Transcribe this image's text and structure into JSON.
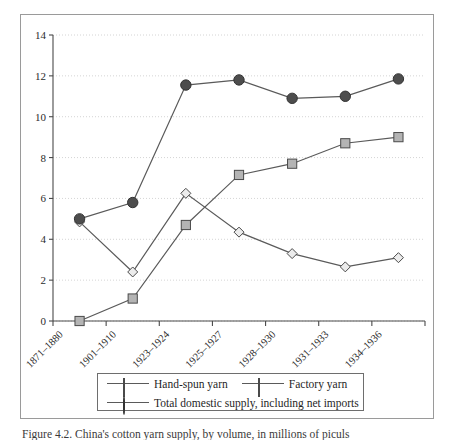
{
  "figure": {
    "caption": "Figure 4.2.   China's cotton yarn supply, by volume, in millions of piculs"
  },
  "chart_data": {
    "type": "line",
    "title": "",
    "xlabel": "",
    "ylabel": "",
    "ylim": [
      0,
      14
    ],
    "yticks": [
      0,
      2,
      4,
      6,
      8,
      10,
      12,
      14
    ],
    "grid": true,
    "legend_position": "bottom",
    "categories": [
      "1871–1880",
      "1901–1910",
      "1923–1924",
      "1925–1927",
      "1928–1930",
      "1931–1933",
      "1934–1936"
    ],
    "series": [
      {
        "name": "Hand-spun yarn",
        "marker": "diamond",
        "marker_fill": "#ececec",
        "line_color": "#5a5a5a",
        "values": [
          4.85,
          2.4,
          6.25,
          4.35,
          3.3,
          2.65,
          3.1
        ]
      },
      {
        "name": "Factory yarn",
        "marker": "square",
        "marker_fill": "#b4b4b4",
        "line_color": "#5a5a5a",
        "values": [
          0.0,
          1.1,
          4.7,
          7.15,
          7.7,
          8.7,
          9.0
        ]
      },
      {
        "name": "Total domestic supply, including net imports",
        "marker": "circle",
        "marker_fill": "#4d4d4d",
        "line_color": "#5a5a5a",
        "values": [
          5.0,
          5.8,
          11.55,
          11.8,
          10.9,
          11.0,
          11.85
        ]
      }
    ]
  },
  "legend": {
    "items": [
      {
        "label": "Hand-spun yarn",
        "icon": "diamond-marker-icon"
      },
      {
        "label": "Factory yarn",
        "icon": "square-marker-icon"
      },
      {
        "label": "Total domestic supply, including net imports",
        "icon": "circle-marker-icon"
      }
    ]
  },
  "axes": {
    "y_tick_labels": [
      "0",
      "2",
      "4",
      "6",
      "8",
      "10",
      "12",
      "14"
    ],
    "x_tick_labels": [
      "1871–1880",
      "1901–1910",
      "1923–1924",
      "1925–1927",
      "1928–1930",
      "1931–1933",
      "1934–1936"
    ]
  },
  "colors": {
    "frame": "#9a9a9a",
    "axis": "#4a4a4a",
    "grid": "#c9c9c9",
    "line": "#5a5a5a",
    "text": "#2b2b2b"
  }
}
